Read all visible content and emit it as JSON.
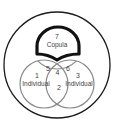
{
  "diagram": {
    "type": "venn",
    "colors": {
      "outer": "#1a1a1a",
      "copula_stroke": "#111111",
      "circles": "#8a8a8a",
      "text": "#444444"
    },
    "copula": {
      "number": "7",
      "label": "Copula"
    },
    "left": {
      "number": "1",
      "label": "Individual"
    },
    "right": {
      "number": "3",
      "label": "Individual"
    },
    "overlap_lower": {
      "number": "2"
    },
    "overlap_center": {
      "number": "4"
    },
    "overlap_left_top": {
      "number": "5"
    },
    "overlap_right_top": {
      "number": "6"
    }
  }
}
